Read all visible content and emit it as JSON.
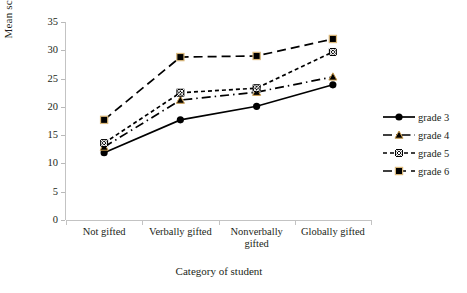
{
  "chart_data": {
    "type": "line",
    "title": "",
    "xlabel": "Category of student",
    "ylabel": "Mean score",
    "categories": [
      "Not gifted",
      "Verbally gifted",
      "Nonverbally gifted",
      "Globally gifted"
    ],
    "category_lines": [
      [
        "Not gifted"
      ],
      [
        "Verbally gifted"
      ],
      [
        "Nonverbally",
        "gifted"
      ],
      [
        "Globally gifted"
      ]
    ],
    "ylim": [
      0,
      35
    ],
    "yticks": [
      0,
      5,
      10,
      15,
      20,
      25,
      30,
      35
    ],
    "grid": false,
    "legend_position": "right",
    "series": [
      {
        "name": "grade 3",
        "values": [
          11.9,
          17.7,
          20.1,
          23.9
        ],
        "marker": "circle",
        "dash": "solid",
        "color": "#000000"
      },
      {
        "name": "grade 4",
        "values": [
          12.9,
          21.2,
          22.6,
          25.3
        ],
        "marker": "triangle",
        "dash": "dashdot",
        "color": "#000000"
      },
      {
        "name": "grade 5",
        "values": [
          13.6,
          22.5,
          23.3,
          29.7
        ],
        "marker": "circled-x",
        "dash": "dotted",
        "color": "#000000"
      },
      {
        "name": "grade 6",
        "values": [
          17.7,
          28.8,
          29.0,
          32.0
        ],
        "marker": "square",
        "dash": "dashed",
        "color": "#000000"
      }
    ]
  },
  "legend": {
    "items": [
      {
        "label": "grade 3"
      },
      {
        "label": "grade 4"
      },
      {
        "label": "grade 5"
      },
      {
        "label": "grade 6"
      }
    ]
  }
}
